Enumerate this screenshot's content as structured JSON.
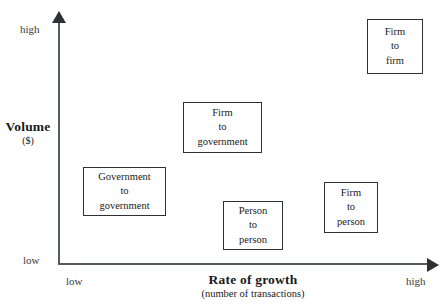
{
  "chart_data": {
    "type": "scatter",
    "title": "",
    "xlabel": "Rate of growth",
    "xlabel_sub": "(number of transactions)",
    "ylabel": "Volume",
    "ylabel_sub": "($)",
    "x_ticks": [
      "low",
      "high"
    ],
    "y_ticks": [
      "low",
      "high"
    ],
    "xlim": [
      "low",
      "high"
    ],
    "ylim": [
      "low",
      "high"
    ],
    "grid": false,
    "legend": "none",
    "points": [
      {
        "label": "Firm to firm",
        "lines": [
          "Firm",
          "to",
          "firm"
        ],
        "x_qualitative": "high",
        "y_qualitative": "high",
        "x_pct": 84,
        "y_pct": 92
      },
      {
        "label": "Firm to government",
        "lines": [
          "Firm",
          "to",
          "government"
        ],
        "x_qualitative": "medium",
        "y_qualitative": "medium-high",
        "x_pct": 35,
        "y_pct": 64
      },
      {
        "label": "Government to government",
        "lines": [
          "Government",
          "to",
          "government"
        ],
        "x_qualitative": "low",
        "y_qualitative": "medium",
        "x_pct": 16,
        "y_pct": 41
      },
      {
        "label": "Person to person",
        "lines": [
          "Person",
          "to",
          "person"
        ],
        "x_qualitative": "medium",
        "y_qualitative": "low",
        "x_pct": 46,
        "y_pct": 16
      },
      {
        "label": "Firm to person",
        "lines": [
          "Firm",
          "to",
          "person"
        ],
        "x_qualitative": "high",
        "y_qualitative": "low-medium",
        "x_pct": 70,
        "y_pct": 28
      }
    ]
  },
  "axes": {
    "y": {
      "title_main": "Volume",
      "title_sub": "($)",
      "tick_high": "high",
      "tick_low": "low"
    },
    "x": {
      "title_main": "Rate of growth",
      "title_sub": "(number of transactions)",
      "tick_low": "low",
      "tick_high": "high"
    }
  },
  "boxes": [
    {
      "name": "firm-to-firm",
      "l1": "Firm",
      "l2": "to",
      "l3": "firm",
      "left": 367,
      "top": 19,
      "width": 56,
      "height": 55
    },
    {
      "name": "firm-to-government",
      "l1": "Firm",
      "l2": "to",
      "l3": "government",
      "left": 183,
      "top": 102,
      "width": 79,
      "height": 51
    },
    {
      "name": "government-to-government",
      "l1": "Government",
      "l2": "to",
      "l3": "government",
      "left": 83,
      "top": 167,
      "width": 83,
      "height": 49
    },
    {
      "name": "person-to-person",
      "l1": "Person",
      "l2": "to",
      "l3": "person",
      "left": 223,
      "top": 201,
      "width": 60,
      "height": 49
    },
    {
      "name": "firm-to-person",
      "l1": "Firm",
      "l2": "to",
      "l3": "person",
      "left": 324,
      "top": 182,
      "width": 54,
      "height": 51
    }
  ]
}
